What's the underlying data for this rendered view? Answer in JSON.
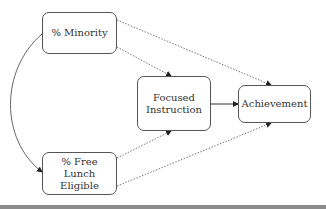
{
  "diagram": {
    "type": "path-model",
    "nodes": [
      {
        "id": "minority",
        "label": "% Minority"
      },
      {
        "id": "freelunch",
        "label": "% Free Lunch Eligible",
        "lines": [
          "% Free Lunch",
          "Eligible"
        ]
      },
      {
        "id": "focused",
        "label": "Focused Instruction",
        "lines": [
          "Focused",
          "Instruction"
        ]
      },
      {
        "id": "achievement",
        "label": "Achievement"
      }
    ],
    "edges": [
      {
        "from": "minority",
        "to": "freelunch",
        "style": "solid",
        "bidirectional": true,
        "curved": true
      },
      {
        "from": "minority",
        "to": "focused",
        "style": "dotted"
      },
      {
        "from": "minority",
        "to": "achievement",
        "style": "dotted"
      },
      {
        "from": "freelunch",
        "to": "focused",
        "style": "dotted"
      },
      {
        "from": "freelunch",
        "to": "achievement",
        "style": "dotted"
      },
      {
        "from": "focused",
        "to": "achievement",
        "style": "solid"
      }
    ],
    "colors": {
      "stroke": "#555555",
      "text": "#333333",
      "background": "#ffffff",
      "bottom_rule": "#8a8a8a"
    }
  }
}
